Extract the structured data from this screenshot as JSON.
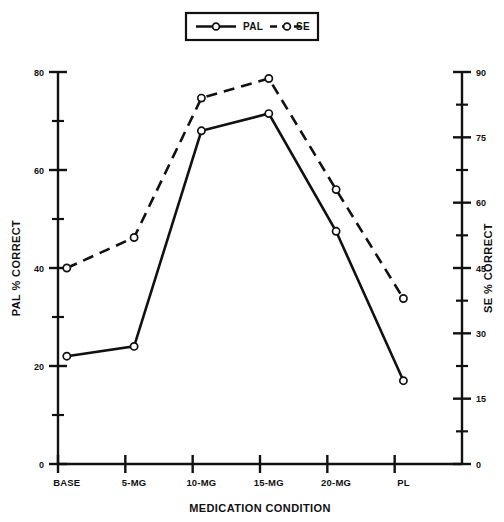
{
  "chart_data": {
    "type": "line",
    "title": "",
    "xlabel": "MEDICATION CONDITION",
    "ylabel": "PAL % CORRECT",
    "y2label": "SE % CORRECT",
    "categories": [
      "BASE",
      "5-MG",
      "10-MG",
      "15-MG",
      "20-MG",
      "PL"
    ],
    "ylim": [
      0,
      80
    ],
    "y2lim": [
      0,
      90
    ],
    "yticks": [
      0,
      20,
      40,
      60,
      80
    ],
    "yticks_minor": [
      10,
      30,
      50,
      70
    ],
    "y2ticks": [
      0,
      15,
      30,
      45,
      60,
      75,
      90
    ],
    "y2ticks_minor": [
      7.5,
      22.5,
      37.5,
      52.5,
      67.5,
      82.5
    ],
    "grid": false,
    "legend_position": "top-center",
    "series": [
      {
        "name": "PAL",
        "axis": "left",
        "linestyle": "solid",
        "marker": "circle-open",
        "color": "#111111",
        "values": [
          22,
          24,
          68,
          71.5,
          47.5,
          17
        ]
      },
      {
        "name": "SE",
        "axis": "right",
        "linestyle": "dashed",
        "marker": "circle-open",
        "color": "#111111",
        "values": [
          45,
          52,
          84,
          88.5,
          63,
          38
        ]
      }
    ]
  },
  "legend": {
    "entries": [
      {
        "label": "PAL",
        "style": "solid"
      },
      {
        "label": "SE",
        "style": "dashed"
      }
    ]
  },
  "axes": {
    "left_title": "PAL % CORRECT",
    "right_title": "SE % CORRECT",
    "bottom_title": "MEDICATION CONDITION"
  }
}
